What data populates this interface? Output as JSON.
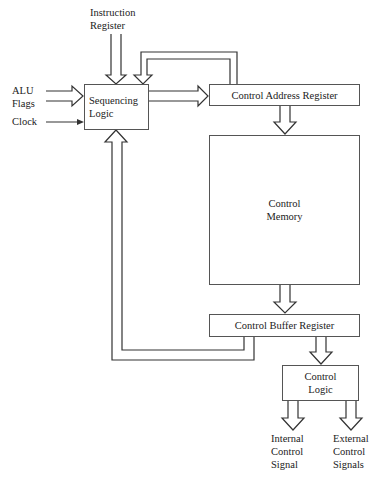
{
  "diagram": {
    "inputs": {
      "instruction_register": [
        "Instruction",
        "Register"
      ],
      "alu_flags": [
        "ALU",
        "Flags"
      ],
      "clock": "Clock"
    },
    "blocks": {
      "sequencing_logic": [
        "Sequencing",
        "Logic"
      ],
      "control_address_register": "Control Address Register",
      "control_memory": [
        "Control",
        "Memory"
      ],
      "control_buffer_register": "Control Buffer Register",
      "control_logic": [
        "Control",
        "Logic"
      ]
    },
    "outputs": {
      "internal_control_signal": [
        "Internal",
        "Control",
        "Signal"
      ],
      "external_control_signals": [
        "External",
        "Control",
        "Signals"
      ]
    },
    "colors": {
      "line": "#333333",
      "box_border": "#555555",
      "background": "#ffffff"
    }
  }
}
